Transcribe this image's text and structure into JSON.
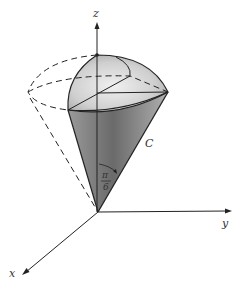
{
  "diagram": {
    "axes": {
      "z_label": "z",
      "y_label": "y",
      "x_label": "x"
    },
    "labels": {
      "curve": "C",
      "angle_numerator": "π",
      "angle_denominator": "6"
    },
    "colors": {
      "line": "#222222",
      "shade_dark": "#6e6e6e",
      "shade_light": "#d8d8d8",
      "background": "#ffffff"
    }
  }
}
